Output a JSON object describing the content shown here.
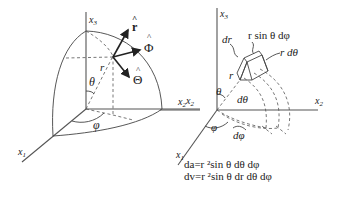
{
  "figure": {
    "left_panel": {
      "axes": {
        "x1": "x",
        "x1_sub": "1",
        "x2": "x",
        "x2_sub": "2",
        "x3": "x",
        "x3_sub": "3"
      },
      "unit_vectors": {
        "r_hat": "r",
        "phi_hat": "Φ",
        "theta_hat": "Θ",
        "hat": "^"
      },
      "labels": {
        "r": "r",
        "theta": "θ",
        "phi": "φ"
      }
    },
    "right_panel": {
      "axes": {
        "x1": "x",
        "x1_sub": "1",
        "x2": "x",
        "x2_sub": "2",
        "x3": "x",
        "x3_sub": "3"
      },
      "labels": {
        "dr": "dr",
        "r_sin_theta_dphi": "r  sin θ dφ",
        "r_dtheta": "r dθ",
        "r": "r",
        "theta": "θ",
        "dtheta": "dθ",
        "phi": "φ",
        "dphi": "dφ"
      },
      "equations": {
        "da": "da=r ²sin θ dθ dφ",
        "dv": "dv=r ²sin θ dr dθ dφ"
      }
    },
    "colors": {
      "ink": "#222222",
      "background": "#ffffff"
    }
  }
}
